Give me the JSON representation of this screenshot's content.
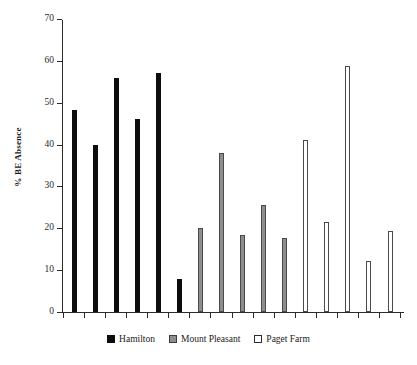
{
  "chart_data": {
    "type": "bar",
    "title": "",
    "xlabel": "",
    "ylabel": "% BE Absence",
    "ylim": [
      0,
      70
    ],
    "yticks": [
      0,
      10,
      20,
      30,
      40,
      50,
      60,
      70
    ],
    "grid": false,
    "legend_position": "bottom",
    "xtick_labels": [],
    "series": [
      {
        "name": "Hamilton",
        "color": "#0d0d0d",
        "values": [
          48.2,
          40.0,
          56.0,
          46.0,
          57.0,
          7.8
        ]
      },
      {
        "name": "Mount Pleasant",
        "color": "#8e8e8e",
        "values": [
          20.0,
          38.0,
          18.5,
          25.5,
          17.6
        ]
      },
      {
        "name": "Paget Farm",
        "color": "#ffffff",
        "values": [
          41.0,
          21.4,
          58.7,
          12.3,
          19.4
        ]
      }
    ]
  },
  "legend": {
    "items": [
      {
        "label": "Hamilton",
        "key": "hamilton"
      },
      {
        "label": "Mount Pleasant",
        "key": "mount-pleasant"
      },
      {
        "label": "Paget Farm",
        "key": "paget-farm"
      }
    ]
  }
}
